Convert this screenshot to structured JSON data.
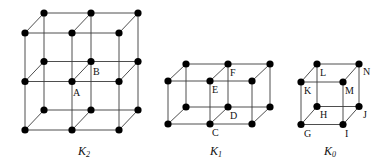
{
  "figure": {
    "complexes": [
      {
        "id": "K2",
        "caption": "K",
        "subscript": "2",
        "caption_pos": [
          78,
          155
        ],
        "grid": {
          "nx": 3,
          "ny": 3,
          "nz": 2
        },
        "back_origin": [
          44,
          13
        ],
        "front_origin": [
          25,
          33
        ],
        "dx": 47,
        "dy": 48.5,
        "labels": [
          {
            "text": "A",
            "x": 73,
            "y": 96
          },
          {
            "text": "B",
            "x": 93,
            "y": 75
          }
        ]
      },
      {
        "id": "K1",
        "caption": "K",
        "subscript": "1",
        "caption_pos": [
          210,
          155
        ],
        "grid": {
          "nx": 3,
          "ny": 2,
          "nz": 2
        },
        "back_origin": [
          186,
          64
        ],
        "front_origin": [
          168,
          81
        ],
        "dx": 42,
        "dy": 43,
        "labels": [
          {
            "text": "C",
            "x": 212,
            "y": 136
          },
          {
            "text": "D",
            "x": 230,
            "y": 119
          },
          {
            "text": "E",
            "x": 212,
            "y": 93
          },
          {
            "text": "F",
            "x": 230,
            "y": 76
          }
        ]
      },
      {
        "id": "K0",
        "caption": "K",
        "subscript": "0",
        "caption_pos": [
          324,
          155
        ],
        "grid": {
          "nx": 2,
          "ny": 2,
          "nz": 2
        },
        "back_origin": [
          317,
          64
        ],
        "front_origin": [
          301,
          82
        ],
        "dx": 42,
        "dy": 42.5,
        "labels": [
          {
            "text": "G",
            "x": 304,
            "y": 137
          },
          {
            "text": "H",
            "x": 320,
            "y": 118
          },
          {
            "text": "I",
            "x": 345,
            "y": 137
          },
          {
            "text": "J",
            "x": 363,
            "y": 118
          },
          {
            "text": "K",
            "x": 304,
            "y": 94
          },
          {
            "text": "L",
            "x": 320,
            "y": 76
          },
          {
            "text": "M",
            "x": 345,
            "y": 94
          },
          {
            "text": "N",
            "x": 363,
            "y": 75
          }
        ]
      }
    ]
  }
}
